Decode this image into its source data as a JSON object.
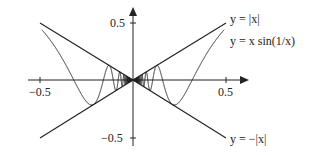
{
  "chart_data": {
    "type": "line",
    "title": "",
    "xlabel": "",
    "ylabel": "",
    "xlim": [
      -0.5,
      0.5
    ],
    "ylim": [
      -0.5,
      0.5
    ],
    "grid": false,
    "legend_position": "inline-right",
    "x_ticks": [
      "-0.5",
      "0.5"
    ],
    "y_ticks": [
      "0.5",
      "-0.5"
    ],
    "series": [
      {
        "name": "y = |x|",
        "function": "abs(x)",
        "x": [
          -0.5,
          0,
          0.5
        ],
        "values": [
          0.5,
          0,
          0.5
        ]
      },
      {
        "name": "y = x sin(1/x)",
        "function": "x*sin(1/x)",
        "x": [
          -0.5,
          -0.4,
          -0.3,
          -0.2,
          -0.15,
          -0.1,
          0,
          0.1,
          0.15,
          0.2,
          0.3,
          0.4,
          0.5
        ],
        "values": [
          0.455,
          0.239,
          -0.058,
          0.192,
          -0.056,
          0.054,
          0,
          0.054,
          -0.056,
          0.192,
          -0.058,
          0.239,
          0.455
        ]
      },
      {
        "name": "y = -|x|",
        "function": "-abs(x)",
        "x": [
          -0.5,
          0,
          0.5
        ],
        "values": [
          -0.5,
          0,
          -0.5
        ]
      }
    ]
  },
  "labels": {
    "y_pos": "0.5",
    "y_neg": "−0.5",
    "x_neg": "−0.5",
    "x_pos": "0.5",
    "abs": "y = |x|",
    "xsin": "y = x sin(1/x)",
    "negabs": "y = −|x|"
  }
}
